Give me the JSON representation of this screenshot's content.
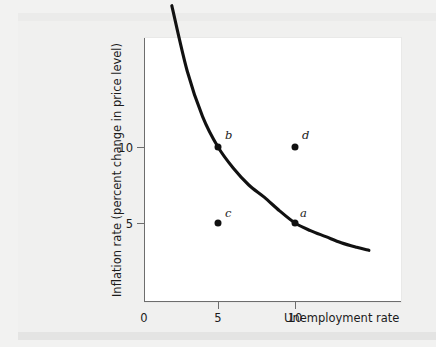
{
  "figure": {
    "background_color": "#f2f2f1",
    "panel_color": "#ffffff",
    "axis_color": "#6d6d6d",
    "curve_color": "#111111",
    "point_color": "#111111"
  },
  "axes": {
    "x_title": "Unemployment rate",
    "y_title": "Inflation rate (percent change in price level)",
    "origin_label": "0",
    "x_ticks": [
      "5",
      "10"
    ],
    "y_ticks": [
      "5",
      "10"
    ]
  },
  "chart_data": {
    "type": "line",
    "title": "",
    "subtitle": "",
    "xlabel": "Unemployment rate",
    "ylabel": "Inflation rate (percent change in price level)",
    "xlim": [
      0,
      16.8
    ],
    "ylim": [
      0,
      19.9
    ],
    "xticks": [
      5,
      10
    ],
    "yticks": [
      5,
      10
    ],
    "grid": false,
    "legend": "none",
    "series": [
      {
        "name": "Phillips curve",
        "type": "line",
        "x": [
          2.0,
          3.0,
          4.0,
          5.0,
          6.0,
          7.0,
          8.0,
          9.0,
          10.0,
          11.0,
          12.0,
          13.0,
          14.0,
          14.8
        ],
        "y": [
          19.3,
          15.0,
          12.0,
          10.0,
          8.6,
          7.5,
          6.7,
          5.8,
          5.0,
          4.5,
          4.1,
          3.7,
          3.4,
          3.2
        ]
      }
    ],
    "points": [
      {
        "label": "b",
        "x": 5,
        "y": 10,
        "on_curve": true,
        "label_position": "upper-right"
      },
      {
        "label": "d",
        "x": 10,
        "y": 10,
        "on_curve": false,
        "label_position": "upper-right"
      },
      {
        "label": "c",
        "x": 5,
        "y": 5,
        "on_curve": false,
        "label_position": "upper-right"
      },
      {
        "label": "a",
        "x": 10,
        "y": 5,
        "on_curve": true,
        "label_position": "upper-right"
      }
    ]
  }
}
